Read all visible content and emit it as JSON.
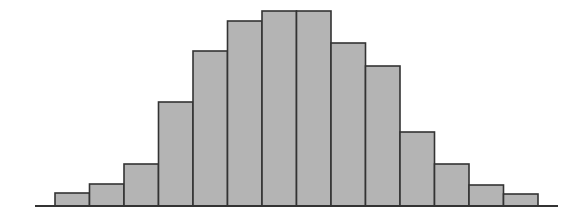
{
  "chart_data": {
    "type": "bar",
    "subtype": "histogram",
    "title": "",
    "xlabel": "",
    "ylabel": "",
    "categories": [
      "1",
      "2",
      "3",
      "4",
      "5",
      "6",
      "7",
      "8",
      "9",
      "10",
      "11",
      "12",
      "13",
      "14"
    ],
    "values": [
      13,
      22,
      42,
      104,
      155,
      185,
      195,
      195,
      163,
      140,
      74,
      42,
      21,
      12
    ],
    "ylim": [
      0,
      200
    ],
    "grid": false,
    "legend": null,
    "bar_color": "#b4b4b4",
    "edge_color": "#333333",
    "axis_color": "#333333"
  },
  "layout": {
    "baseline_y": 206,
    "axis_x0": 35,
    "axis_x1": 558,
    "bar_x0": 55,
    "bar_width": 34.5
  }
}
